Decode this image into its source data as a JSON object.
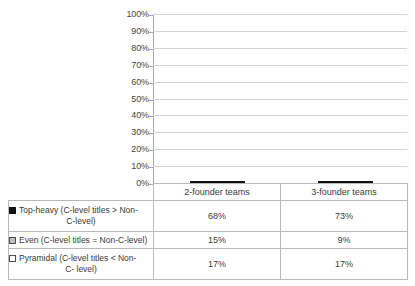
{
  "chart_data": {
    "type": "bar",
    "subtype": "100% stacked column with data table",
    "title": "",
    "xlabel": "",
    "ylabel": "",
    "ylim": [
      0,
      100
    ],
    "grid": true,
    "legend_position": "data-table-left-column",
    "categories": [
      "2-founder teams",
      "3-founder teams"
    ],
    "series": [
      {
        "name": "Top-heavy (C-level titles > Non-C-level)",
        "marker": "filled-black-square",
        "color": "#111111",
        "values": [
          68,
          73
        ],
        "labels": [
          "68%",
          "73%"
        ]
      },
      {
        "name": "Even (C-level titles = Non-C-level)",
        "marker": "gray-square",
        "color": "#BFBFBF",
        "values": [
          15,
          9
        ],
        "labels": [
          "15%",
          "9%"
        ]
      },
      {
        "name": "Pyramidal (C-level titles < Non-C- level)",
        "marker": "empty-white-square",
        "color": "#FFFFFF",
        "values": [
          17,
          17
        ],
        "labels": [
          "17%",
          "17%"
        ]
      }
    ],
    "yticks": [
      "0%",
      "10%",
      "20%",
      "30%",
      "40%",
      "50%",
      "60%",
      "70%",
      "80%",
      "90%",
      "100%"
    ],
    "ytick_values": [
      0,
      10,
      20,
      30,
      40,
      50,
      60,
      70,
      80,
      90,
      100
    ]
  },
  "legend_rows": [
    {
      "line1": "Top-heavy (C-level titles > Non-",
      "line2": "C-level)"
    },
    {
      "line1": "Even (C-level titles = Non-C-level)",
      "line2": ""
    },
    {
      "line1": "Pyramidal (C-level titles < Non-",
      "line2": "C- level)"
    }
  ],
  "table": {
    "headers": [
      "2-founder teams",
      "3-founder teams"
    ],
    "rows": [
      {
        "values": [
          "68%",
          "73%"
        ]
      },
      {
        "values": [
          "15%",
          "9%"
        ]
      },
      {
        "values": [
          "17%",
          "17%"
        ]
      }
    ]
  },
  "colors": {
    "top_heavy": "#111111",
    "even": "#BFBFBF",
    "pyramidal": "#FFFFFF",
    "gridline": "#D4D4D4",
    "axis": "#A6A6A6",
    "table_border": "#B8B8B8",
    "text": "#3A3A3A"
  }
}
